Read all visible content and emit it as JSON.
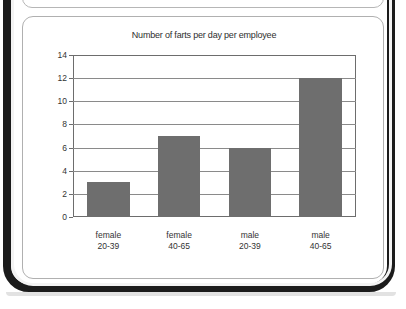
{
  "page": {
    "background_color": "#ffffff",
    "edge_color": "#1b1b1b"
  },
  "chart_panel": {
    "border_color": "#b0b0b0",
    "background_color": "#ffffff"
  },
  "chart_data": {
    "type": "bar",
    "title": "Number of farts per day per employee",
    "xlabel": "",
    "ylabel": "",
    "categories": [
      "female 20-39",
      "female 40-65",
      "male 20-39",
      "male 40-65"
    ],
    "category_lines": [
      [
        "female",
        "20-39"
      ],
      [
        "female",
        "40-65"
      ],
      [
        "male",
        "20-39"
      ],
      [
        "male",
        "40-65"
      ]
    ],
    "values": [
      3,
      7,
      6,
      12
    ],
    "ylim": [
      0,
      14
    ],
    "yticks": [
      0,
      2,
      4,
      6,
      8,
      10,
      12,
      14
    ],
    "ytick_labels": [
      "0",
      "2",
      "4",
      "6",
      "8",
      "10",
      "12",
      "14"
    ],
    "grid": true,
    "legend": null,
    "bar_color": "#6e6e6e",
    "axis_color": "#6d6d6d",
    "grid_color": "#8a8a8a"
  }
}
